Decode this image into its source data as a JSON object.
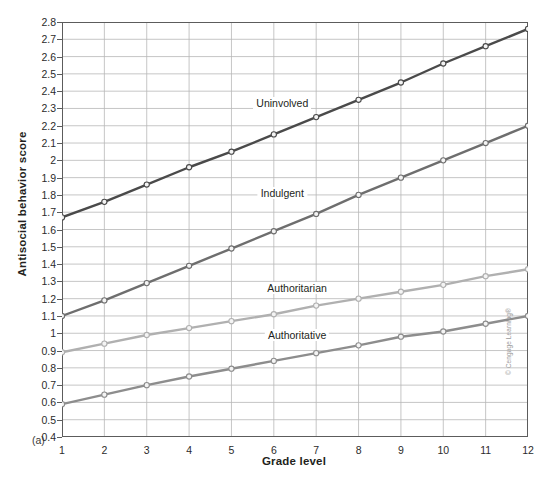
{
  "figure": {
    "panel_letter": "(a)",
    "credit": "© Cengage Learning®",
    "caption_stub": ""
  },
  "chart_data": {
    "type": "line",
    "title": "",
    "xlabel": "Grade level",
    "ylabel": "Antisocial behavior score",
    "x": [
      1,
      2,
      3,
      4,
      5,
      6,
      7,
      8,
      9,
      10,
      11,
      12
    ],
    "xtick_labels": [
      "1",
      "2",
      "3",
      "4",
      "5",
      "6",
      "7",
      "8",
      "9",
      "10",
      "11",
      "12"
    ],
    "xlim": [
      1,
      12
    ],
    "ylim": [
      0.4,
      2.8
    ],
    "ytick_labels": [
      "0.4",
      "0.5",
      "0.6",
      "0.7",
      "0.8",
      "0.9",
      "1",
      "1.1",
      "1.2",
      "1.3",
      "1.4",
      "1.5",
      "1.6",
      "1.7",
      "1.8",
      "1.9",
      "2",
      "2.1",
      "2.2",
      "2.3",
      "2.4",
      "2.5",
      "2.6",
      "2.7",
      "2.8"
    ],
    "ytick_values": [
      0.4,
      0.5,
      0.6,
      0.7,
      0.8,
      0.9,
      1.0,
      1.1,
      1.2,
      1.3,
      1.4,
      1.5,
      1.6,
      1.7,
      1.8,
      1.9,
      2.0,
      2.1,
      2.2,
      2.3,
      2.4,
      2.5,
      2.6,
      2.7,
      2.8
    ],
    "grid": true,
    "grid_color": "#b7b7b7",
    "legend_position": "inline-annotations",
    "markers": "open-circle",
    "series": [
      {
        "name": "Uninvolved",
        "color": "#4a4a4a",
        "label_x": 6.2,
        "label_y": 2.33,
        "values": [
          1.67,
          1.76,
          1.86,
          1.96,
          2.05,
          2.15,
          2.25,
          2.35,
          2.45,
          2.56,
          2.66,
          2.76
        ]
      },
      {
        "name": "Indulgent",
        "color": "#6e6e6e",
        "label_x": 6.2,
        "label_y": 1.81,
        "values": [
          1.1,
          1.19,
          1.29,
          1.39,
          1.49,
          1.59,
          1.69,
          1.8,
          1.9,
          2.0,
          2.1,
          2.2
        ]
      },
      {
        "name": "Authoritarian",
        "color": "#b0b0b0",
        "label_x": 6.55,
        "label_y": 1.26,
        "values": [
          0.89,
          0.94,
          0.99,
          1.03,
          1.07,
          1.11,
          1.16,
          1.2,
          1.24,
          1.28,
          1.33,
          1.37
        ]
      },
      {
        "name": "Authoritative",
        "color": "#8d8d8d",
        "label_x": 6.55,
        "label_y": 0.99,
        "values": [
          0.59,
          0.645,
          0.7,
          0.75,
          0.795,
          0.84,
          0.885,
          0.93,
          0.98,
          1.01,
          1.055,
          1.1
        ]
      }
    ]
  }
}
